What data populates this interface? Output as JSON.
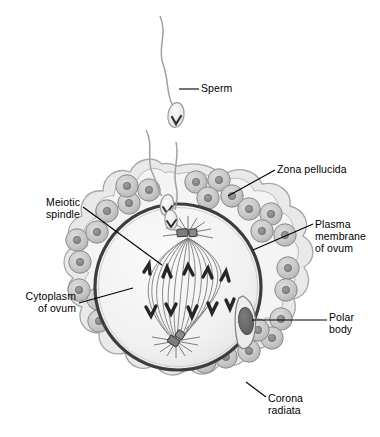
{
  "figure": {
    "type": "biological-diagram",
    "background": "#ffffff"
  },
  "labels": {
    "sperm": "Sperm",
    "zona_pellucida": "Zona pellucida",
    "plasma_membrane": "Plasma\nmembrane\nof ovum",
    "meiotic_spindle": "Meiotic\nspindle",
    "cytoplasm": "Cytoplasm\nof ovum",
    "polar_body": "Polar\nbody",
    "corona_radiata": "Corona\nradiata"
  },
  "structures": {
    "ovum": {
      "name": "ovum",
      "center": [
        178,
        287
      ],
      "radius": 83,
      "cytoplasm_fill": "#f2f2f2",
      "membrane_stroke": "#3b3b3b",
      "membrane_width": 3.2
    },
    "zona_pellucida": {
      "name": "zona-pellucida",
      "fill": "#e4e4e4",
      "stroke": "#9a9a9a"
    },
    "corona_radiata": {
      "name": "corona-radiata",
      "cell_count": 22,
      "cell_fill": "#c9c9c9",
      "cell_stroke": "#8c8c8c",
      "nucleus_fill": "#8f8f8f",
      "nucleus_stroke": "#6f6f6f",
      "cell_radius": 11,
      "nucleus_radius": 3.6
    },
    "meiotic_spindle": {
      "name": "meiotic-spindle",
      "fiber_stroke": "#6e6e6e",
      "fiber_count": 16,
      "top_pole": [
        188,
        235
      ],
      "bottom_pole": [
        175,
        339
      ],
      "chromosome_fill": "#2b2b2b",
      "chromosome_count_upper": 5,
      "chromosome_count_lower": 5,
      "centriole_fill": "#787878",
      "centriole_stroke": "#3a3a3a"
    },
    "polar_body": {
      "name": "polar-body",
      "center": [
        246,
        321
      ],
      "fill": "#6b6b6b",
      "stroke": "#4a4a4a",
      "pocket_fill": "#ededed"
    },
    "sperm": {
      "name": "sperm",
      "count": 3,
      "head_fill": "#efefef",
      "head_stroke": "#9a9a9a",
      "tail_stroke": "#9e9e9e",
      "mark_fill": "#2f2f2f"
    }
  },
  "leaders": {
    "stroke": "#000000",
    "width": 1.1
  },
  "label_positions": {
    "sperm": {
      "left": 201,
      "top": 82,
      "align": "l"
    },
    "zona_pellucida": {
      "left": 277,
      "top": 163,
      "align": "l"
    },
    "plasma_membrane": {
      "left": 315,
      "top": 218,
      "align": "l"
    },
    "meiotic_spindle": {
      "left": 14,
      "top": 196,
      "align": "r",
      "width": 66
    },
    "cytoplasm": {
      "left": 2,
      "top": 290,
      "align": "r",
      "width": 74
    },
    "polar_body": {
      "left": 329,
      "top": 311,
      "align": "l"
    },
    "corona_radiata": {
      "left": 268,
      "top": 392,
      "align": "l"
    }
  }
}
